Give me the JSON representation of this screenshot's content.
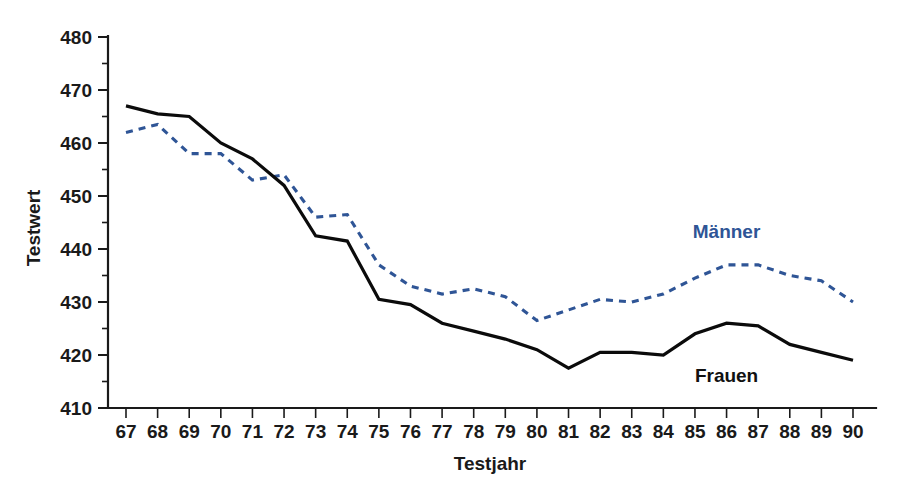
{
  "chart_data": {
    "type": "line",
    "title": "",
    "xlabel": "Testjahr",
    "ylabel": "Testwert",
    "categories": [
      "67",
      "68",
      "69",
      "70",
      "71",
      "72",
      "73",
      "74",
      "75",
      "76",
      "77",
      "78",
      "79",
      "80",
      "81",
      "82",
      "83",
      "84",
      "85",
      "86",
      "87",
      "88",
      "89",
      "90"
    ],
    "xlim": [
      67,
      90
    ],
    "ylim": [
      410,
      480
    ],
    "y_ticks": [
      410,
      420,
      430,
      440,
      450,
      460,
      470,
      480
    ],
    "y_minor_tick_step": 5,
    "grid": false,
    "legend_position": "inline-annotation",
    "series": [
      {
        "name": "Männer",
        "style": "dashed",
        "color": "#2f5596",
        "values": [
          462,
          463.5,
          458,
          458,
          453,
          454,
          446,
          446.5,
          437,
          433,
          431.5,
          432.5,
          431,
          426.5,
          428.5,
          430.5,
          430,
          431.5,
          434.5,
          437,
          437,
          435,
          434,
          430
        ]
      },
      {
        "name": "Frauen",
        "style": "solid",
        "color": "#0b0b0b",
        "values": [
          467,
          465.5,
          465,
          460,
          457,
          452,
          442.5,
          441.5,
          430.5,
          429.5,
          426,
          424.5,
          423,
          421,
          417.5,
          420.5,
          420.5,
          420,
          424,
          426,
          425.5,
          422,
          420.5,
          419
        ]
      }
    ],
    "annotations": [
      {
        "text": "Männer",
        "x_year": 86,
        "y_value": 442,
        "color": "#2f5596"
      },
      {
        "text": "Frauen",
        "x_year": 86,
        "y_value": 415,
        "color": "#111111"
      }
    ]
  },
  "axis": {
    "y_label": "Testwert",
    "x_label": "Testjahr",
    "y_tick_labels": [
      "480",
      "470",
      "460",
      "450",
      "440",
      "430",
      "420",
      "410"
    ],
    "x_tick_labels": [
      "67",
      "68",
      "69",
      "70",
      "71",
      "72",
      "73",
      "74",
      "75",
      "76",
      "77",
      "78",
      "79",
      "80",
      "81",
      "82",
      "83",
      "84",
      "85",
      "86",
      "87",
      "88",
      "89",
      "90"
    ]
  },
  "legend": {
    "maenner_label": "Männer",
    "frauen_label": "Frauen"
  },
  "colors": {
    "maenner": "#2f5596",
    "frauen": "#0b0b0b",
    "axis": "#1a1a1a",
    "background": "#ffffff"
  }
}
